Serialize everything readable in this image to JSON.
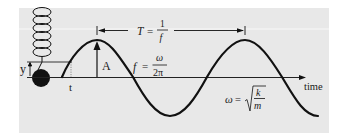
{
  "diagram": {
    "colors": {
      "panel": "#e8e8e8",
      "page": "#ffffff",
      "ink": "#111111",
      "highlight_line": "#f6f6f6"
    },
    "labels": {
      "displacement": "y",
      "time_marker": "t",
      "amplitude": "A",
      "axis": "time"
    },
    "period_equation": {
      "lhs": "T",
      "eq": "=",
      "numerator": "1",
      "denominator": "f"
    },
    "frequency_equation": {
      "lhs": "f",
      "eq": "=",
      "numerator": "ω",
      "denominator": "2π"
    },
    "angular_equation": {
      "lhs": "ω",
      "eq": "=",
      "radicand_numerator": "k",
      "radicand_denominator": "m"
    },
    "elements": [
      "spring",
      "mass-ball",
      "sine-wave",
      "time-axis",
      "amplitude-arrow",
      "period-bracket"
    ]
  }
}
